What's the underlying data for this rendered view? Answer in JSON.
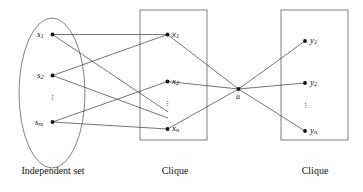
{
  "figure": {
    "type": "graph-reduction-diagram",
    "background_color": "#ffffff",
    "stroke_color": "#3a3a3a",
    "node_color": "#111111"
  },
  "groups": [
    {
      "id": "independent-set",
      "label": "Independent set",
      "shape": "ellipse",
      "label_x": 53,
      "label_y": 172,
      "bounds": {
        "cx": 52,
        "cy": 93,
        "rx": 33,
        "ry": 75
      }
    },
    {
      "id": "clique-middle",
      "label": "Clique",
      "shape": "rectangle",
      "label_x": 175,
      "label_y": 172,
      "bounds": {
        "x": 140,
        "y": 10,
        "w": 67,
        "h": 130
      }
    },
    {
      "id": "clique-right",
      "label": "Clique",
      "shape": "rectangle",
      "label_x": 315,
      "label_y": 172,
      "bounds": {
        "x": 281,
        "y": 10,
        "w": 67,
        "h": 130
      }
    }
  ],
  "nodes": [
    {
      "id": "s1",
      "base": "s",
      "sub": "1",
      "x": 52.5,
      "y": 34.5,
      "label_side": "left",
      "group": "independent-set"
    },
    {
      "id": "s2",
      "base": "s",
      "sub": "2",
      "x": 52.5,
      "y": 75.5,
      "label_side": "left",
      "group": "independent-set"
    },
    {
      "id": "sm",
      "base": "s",
      "sub": "m",
      "x": 52.5,
      "y": 122.0,
      "label_side": "left",
      "group": "independent-set"
    },
    {
      "id": "x1",
      "base": "x",
      "sub": "1",
      "x": 167.5,
      "y": 34.5,
      "label_side": "right",
      "group": "clique-middle"
    },
    {
      "id": "x2",
      "base": "x",
      "sub": "2",
      "x": 167.5,
      "y": 81.5,
      "label_side": "right",
      "group": "clique-middle"
    },
    {
      "id": "xn",
      "base": "x",
      "sub": "n",
      "x": 167.5,
      "y": 129.0,
      "label_side": "right",
      "group": "clique-middle"
    },
    {
      "id": "u",
      "base": "u",
      "sub": "",
      "x": 238.5,
      "y": 89.0,
      "label_side": "below",
      "group": "bridge"
    },
    {
      "id": "y1",
      "base": "y",
      "sub": "1",
      "x": 305.0,
      "y": 41.0,
      "label_side": "right",
      "group": "clique-right"
    },
    {
      "id": "y2",
      "base": "y",
      "sub": "2",
      "x": 305.0,
      "y": 83.0,
      "label_side": "right",
      "group": "clique-right"
    },
    {
      "id": "yn",
      "base": "y",
      "sub": "n",
      "x": 305.0,
      "y": 131.0,
      "label_side": "right",
      "group": "clique-right"
    }
  ],
  "ellipsis_marks": [
    {
      "id": "dots-s",
      "x": 52.5,
      "y": 99.0
    },
    {
      "id": "dots-x",
      "x": 167.5,
      "y": 105.0
    },
    {
      "id": "dots-y",
      "x": 305.0,
      "y": 107.0
    }
  ],
  "edges": [
    {
      "from": "s1",
      "to": "x1"
    },
    {
      "from": "s1",
      "to": "xd",
      "x2": 168.0,
      "y2": 112.0
    },
    {
      "from": "s2",
      "to": "x1"
    },
    {
      "from": "s2",
      "to": "xd2",
      "x2": 168.0,
      "y2": 118.0
    },
    {
      "from": "sm",
      "to": "x2"
    },
    {
      "from": "sm",
      "to": "xn"
    },
    {
      "from": "x1",
      "to": "u"
    },
    {
      "from": "x2",
      "to": "u"
    },
    {
      "from": "xn",
      "to": "u"
    },
    {
      "from": "u",
      "to": "y1"
    },
    {
      "from": "u",
      "to": "y2"
    },
    {
      "from": "u",
      "to": "yn"
    }
  ]
}
